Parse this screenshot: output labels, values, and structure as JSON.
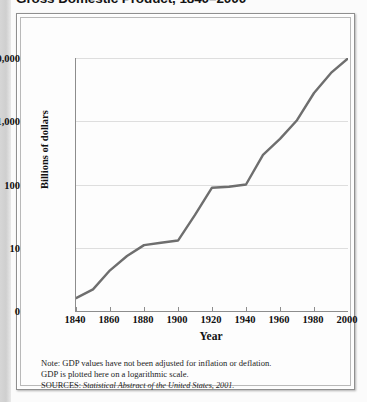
{
  "figure": {
    "title": "Gross Domestic Product, 1840–2000",
    "notes": [
      "Note: GDP values have not been adjusted for inflation or deflation.",
      "GDP is plotted here on a logarithmic scale."
    ],
    "source_prefix": "SOURCES:",
    "source_text": "Statistical Abstract of the United States, 2001.",
    "line_color": "#6e6e6e",
    "grid_color": "#dedede",
    "axis_color": "#8d8d8d"
  },
  "chart_data": {
    "type": "line",
    "title": "Gross Domestic Product, 1840–2000",
    "xlabel": "Year",
    "ylabel": "Billions of dollars",
    "yscale": "log",
    "grid": true,
    "legend": "none",
    "ylim": [
      1,
      10000
    ],
    "xlim": [
      1840,
      2000
    ],
    "ytick_labels": [
      "10,000",
      "1,000",
      "100",
      "10",
      "0"
    ],
    "ytick_values": [
      10000,
      1000,
      100,
      10,
      1
    ],
    "xtick_labels": [
      "1840",
      "1860",
      "1880",
      "1900",
      "1920",
      "1940",
      "1960",
      "1980",
      "2000"
    ],
    "xtick_values": [
      1840,
      1860,
      1880,
      1900,
      1920,
      1940,
      1960,
      1980,
      2000
    ],
    "series": [
      {
        "name": "Gross Domestic Product",
        "x": [
          1840,
          1850,
          1860,
          1870,
          1880,
          1890,
          1900,
          1910,
          1920,
          1930,
          1940,
          1950,
          1960,
          1970,
          1980,
          1990,
          2000
        ],
        "y": [
          1.6,
          2.2,
          4.4,
          7.4,
          11.0,
          12.0,
          13.0,
          33.0,
          89.0,
          92.0,
          100.0,
          294.0,
          526.0,
          1039.0,
          2796.0,
          5803.0,
          9873.0
        ]
      }
    ]
  }
}
